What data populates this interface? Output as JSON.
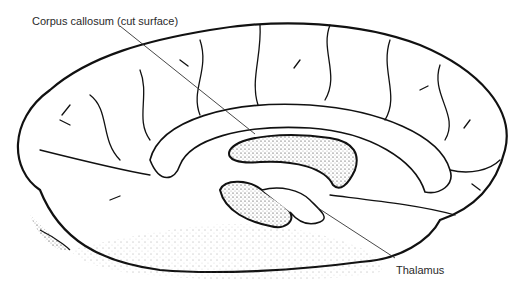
{
  "diagram": {
    "labels": [
      {
        "id": "corpus-callosum",
        "text": "Corpus callosum (cut surface)",
        "x": 32,
        "y": 15
      },
      {
        "id": "thalamus",
        "text": "Thalamus",
        "x": 396,
        "y": 264
      }
    ],
    "colors": {
      "ink": "#111111",
      "text": "#2a2a2a",
      "background": "#ffffff"
    }
  }
}
